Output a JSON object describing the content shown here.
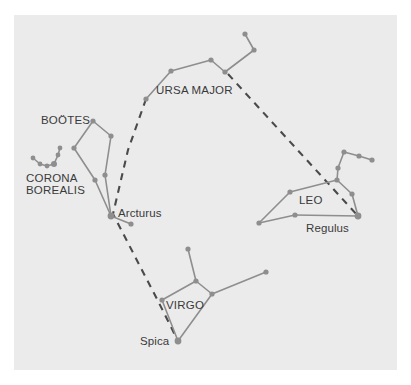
{
  "figure": {
    "background_color": "#ffffff",
    "panel_color": "#ebebeb",
    "star_color": "#8e8e8e",
    "line_color": "#8e8e8e",
    "guide_color": "#4a4a4a",
    "text_color": "#3a3a3a",
    "panel": {
      "x": 14,
      "y": 15,
      "width": 383,
      "height": 355
    }
  },
  "chart_data": {
    "type": "scatter",
    "title": "",
    "xlabel": "",
    "ylabel": "",
    "grid": false,
    "legend": "none",
    "xlim": [
      0,
      411
    ],
    "ylim": [
      0,
      385
    ],
    "constellations": [
      {
        "name": "URSA MAJOR",
        "label": {
          "text": "URSA MAJOR",
          "x": 156,
          "y": 94,
          "anchor": "start"
        },
        "stars": [
          {
            "id": "um1",
            "x": 146,
            "y": 99,
            "r": 2.6
          },
          {
            "id": "um2",
            "x": 171,
            "y": 71,
            "r": 2.6
          },
          {
            "id": "um3",
            "x": 211,
            "y": 60,
            "r": 2.6
          },
          {
            "id": "um4",
            "x": 225,
            "y": 72,
            "r": 2.6
          },
          {
            "id": "um5",
            "x": 254,
            "y": 50,
            "r": 2.6
          },
          {
            "id": "um6",
            "x": 245,
            "y": 34,
            "r": 2.6
          }
        ],
        "lines": [
          [
            "um1",
            "um2"
          ],
          [
            "um2",
            "um3"
          ],
          [
            "um3",
            "um4"
          ],
          [
            "um4",
            "um5"
          ],
          [
            "um5",
            "um6"
          ]
        ]
      },
      {
        "name": "BOÖTES",
        "label": {
          "text": "BOÖTES",
          "x": 41,
          "y": 124,
          "anchor": "start"
        },
        "stars": [
          {
            "id": "bo_top",
            "x": 93,
            "y": 121,
            "r": 2.6
          },
          {
            "id": "bo_right",
            "x": 111,
            "y": 136,
            "r": 2.6
          },
          {
            "id": "bo_mid",
            "x": 105,
            "y": 175,
            "r": 2.6
          },
          {
            "id": "bo_left",
            "x": 74,
            "y": 148,
            "r": 2.6
          },
          {
            "id": "bo_low",
            "x": 95,
            "y": 180,
            "r": 2.6
          },
          {
            "id": "bo_arcturus",
            "x": 111,
            "y": 216,
            "r": 3.4
          },
          {
            "id": "bo_tail",
            "x": 131,
            "y": 224,
            "r": 2.6
          }
        ],
        "lines": [
          [
            "bo_top",
            "bo_right"
          ],
          [
            "bo_right",
            "bo_mid"
          ],
          [
            "bo_top",
            "bo_left"
          ],
          [
            "bo_left",
            "bo_low"
          ],
          [
            "bo_low",
            "bo_arcturus"
          ],
          [
            "bo_mid",
            "bo_arcturus"
          ],
          [
            "bo_arcturus",
            "bo_tail"
          ]
        ]
      },
      {
        "name": "CORONA BOREALIS",
        "label": {
          "text": "CORONA",
          "x": 26,
          "y": 182,
          "anchor": "start"
        },
        "label2": {
          "text": "BOREALIS",
          "x": 26,
          "y": 194,
          "anchor": "start"
        },
        "stars": [
          {
            "id": "cb1",
            "x": 33,
            "y": 158,
            "r": 2.4
          },
          {
            "id": "cb2",
            "x": 40,
            "y": 164,
            "r": 2.4
          },
          {
            "id": "cb3",
            "x": 47,
            "y": 166,
            "r": 2.4
          },
          {
            "id": "cb4",
            "x": 54,
            "y": 164,
            "r": 3.0
          },
          {
            "id": "cb5",
            "x": 58,
            "y": 155,
            "r": 2.4
          },
          {
            "id": "cb6",
            "x": 60,
            "y": 148,
            "r": 2.4
          }
        ],
        "lines": [
          [
            "cb1",
            "cb2"
          ],
          [
            "cb2",
            "cb3"
          ],
          [
            "cb3",
            "cb4"
          ],
          [
            "cb4",
            "cb5"
          ],
          [
            "cb5",
            "cb6"
          ]
        ]
      },
      {
        "name": "LEO",
        "label": {
          "text": "LEO",
          "x": 299,
          "y": 204,
          "anchor": "start"
        },
        "stars": [
          {
            "id": "leo_regulus",
            "x": 358,
            "y": 216,
            "r": 3.4
          },
          {
            "id": "leo_eta",
            "x": 352,
            "y": 194,
            "r": 2.6
          },
          {
            "id": "leo_gamma",
            "x": 337,
            "y": 180,
            "r": 2.6
          },
          {
            "id": "leo_zeta",
            "x": 338,
            "y": 168,
            "r": 2.6
          },
          {
            "id": "leo_mu",
            "x": 344,
            "y": 152,
            "r": 2.6
          },
          {
            "id": "leo_eps",
            "x": 359,
            "y": 156,
            "r": 2.6
          },
          {
            "id": "leo_lam",
            "x": 372,
            "y": 160,
            "r": 2.6
          },
          {
            "id": "leo_delta",
            "x": 290,
            "y": 192,
            "r": 2.6
          },
          {
            "id": "leo_theta",
            "x": 295,
            "y": 215,
            "r": 2.6
          },
          {
            "id": "leo_denebola",
            "x": 259,
            "y": 223,
            "r": 2.6
          }
        ],
        "lines": [
          [
            "leo_regulus",
            "leo_eta"
          ],
          [
            "leo_eta",
            "leo_gamma"
          ],
          [
            "leo_gamma",
            "leo_zeta"
          ],
          [
            "leo_zeta",
            "leo_mu"
          ],
          [
            "leo_mu",
            "leo_eps"
          ],
          [
            "leo_eps",
            "leo_lam"
          ],
          [
            "leo_gamma",
            "leo_delta"
          ],
          [
            "leo_delta",
            "leo_denebola"
          ],
          [
            "leo_denebola",
            "leo_theta"
          ],
          [
            "leo_theta",
            "leo_regulus"
          ]
        ]
      },
      {
        "name": "VIRGO",
        "label": {
          "text": "VIRGO",
          "x": 166,
          "y": 309,
          "anchor": "start"
        },
        "stars": [
          {
            "id": "vir_spica",
            "x": 178,
            "y": 341,
            "r": 3.4
          },
          {
            "id": "vir_left",
            "x": 162,
            "y": 300,
            "r": 2.6
          },
          {
            "id": "vir_up",
            "x": 196,
            "y": 281,
            "r": 2.6
          },
          {
            "id": "vir_top",
            "x": 188,
            "y": 249,
            "r": 2.6
          },
          {
            "id": "vir_cent",
            "x": 212,
            "y": 294,
            "r": 2.6
          },
          {
            "id": "vir_right",
            "x": 266,
            "y": 272,
            "r": 2.6
          }
        ],
        "lines": [
          [
            "vir_left",
            "vir_up"
          ],
          [
            "vir_up",
            "vir_top"
          ],
          [
            "vir_up",
            "vir_cent"
          ],
          [
            "vir_cent",
            "vir_right"
          ],
          [
            "vir_cent",
            "vir_spica"
          ],
          [
            "vir_left",
            "vir_spica"
          ]
        ]
      }
    ],
    "guides": [
      {
        "name": "arc-to-arcturus-to-spica",
        "points": [
          [
            146,
            99
          ],
          [
            128,
            150
          ],
          [
            113,
            214
          ],
          [
            158,
            301
          ],
          [
            178,
            341
          ]
        ]
      },
      {
        "name": "ursa-major-to-regulus",
        "points": [
          [
            228,
            74
          ],
          [
            358,
            216
          ]
        ]
      }
    ],
    "star_labels": [
      {
        "text": "Arcturus",
        "x": 118,
        "y": 217,
        "anchor": "start"
      },
      {
        "text": "Regulus",
        "x": 306,
        "y": 232,
        "anchor": "start"
      },
      {
        "text": "Spica",
        "x": 140,
        "y": 345,
        "anchor": "start"
      }
    ]
  }
}
